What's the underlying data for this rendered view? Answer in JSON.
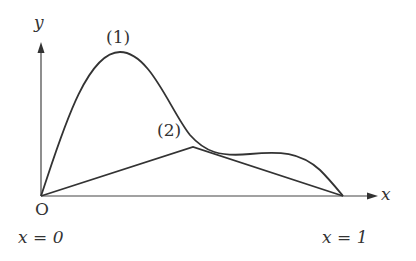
{
  "axes": {
    "x_label": "x",
    "y_label": "y",
    "origin_label": "O"
  },
  "curves": [
    {
      "id": "1",
      "label": "(1)",
      "type": "smooth"
    },
    {
      "id": "2",
      "label": "(2)",
      "type": "piecewise-linear"
    }
  ],
  "ticks": {
    "x0": "x = 0",
    "x1": "x = 1"
  },
  "colors": {
    "stroke": "#333333"
  }
}
